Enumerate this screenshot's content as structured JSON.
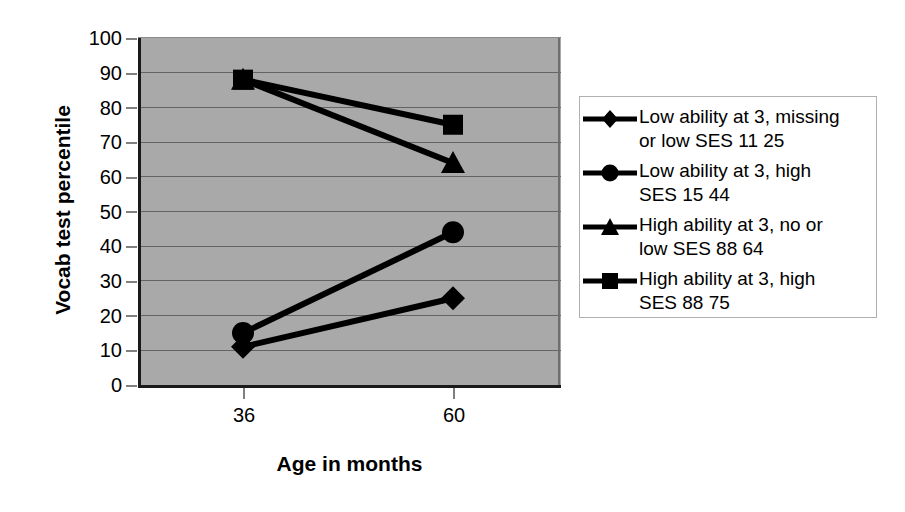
{
  "chart_data": {
    "type": "line",
    "title": "",
    "xlabel": "Age in months",
    "ylabel": "Vocab test percentile",
    "categories": [
      "36",
      "60"
    ],
    "x": [
      36,
      60
    ],
    "xtick_labels": [
      "36",
      "60"
    ],
    "ylim": [
      0,
      100
    ],
    "ytick_labels": [
      "100",
      "90",
      "80",
      "70",
      "60",
      "50",
      "40",
      "30",
      "20",
      "10",
      "0"
    ],
    "yticks": [
      100,
      90,
      80,
      70,
      60,
      50,
      40,
      30,
      20,
      10,
      0
    ],
    "grid": true,
    "legend_position": "right",
    "plot_background": "#a9a9a9",
    "line_color": "#000000",
    "series": [
      {
        "name": "Low ability at 3, missing or low SES 11 25",
        "marker": "diamond",
        "values": [
          11,
          25
        ]
      },
      {
        "name": "Low ability at 3, high SES 15 44",
        "marker": "circle",
        "values": [
          15,
          44
        ]
      },
      {
        "name": "High ability at 3, no or low SES 88 64",
        "marker": "triangle",
        "values": [
          88,
          64
        ]
      },
      {
        "name": "High ability at 3, high SES 88 75",
        "marker": "square",
        "values": [
          88,
          75
        ]
      }
    ]
  },
  "axis": {
    "y_title": "Vocab test percentile",
    "x_title": "Age in months",
    "y_labels": [
      "100",
      "90",
      "80",
      "70",
      "60",
      "50",
      "40",
      "30",
      "20",
      "10",
      "0"
    ],
    "x_labels": [
      "36",
      "60"
    ]
  },
  "legend": {
    "items": [
      {
        "marker": "diamond-marker",
        "label": "Low ability at 3, missing\nor low SES 11 25"
      },
      {
        "marker": "circle-marker",
        "label": "Low ability at 3, high\nSES 15 44"
      },
      {
        "marker": "triangle-marker",
        "label": "High ability at 3, no or\nlow SES 88 64"
      },
      {
        "marker": "square-marker",
        "label": "High ability at 3, high\nSES 88 75"
      }
    ]
  }
}
